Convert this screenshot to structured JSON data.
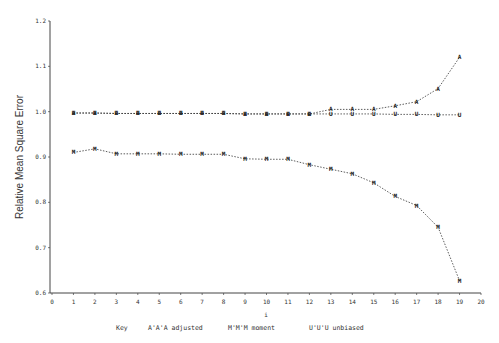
{
  "chart_data": {
    "type": "line",
    "title": "",
    "xlabel": "i",
    "ylabel": "Relative Mean Square Error",
    "xlim": [
      0,
      20
    ],
    "ylim": [
      0.6,
      1.2
    ],
    "x_ticks": [
      "0",
      "1",
      "2",
      "3",
      "4",
      "5",
      "6",
      "7",
      "8",
      "9",
      "10",
      "11",
      "12",
      "13",
      "14",
      "15",
      "16",
      "17",
      "18",
      "19",
      "20"
    ],
    "y_ticks": [
      "0.6",
      "0.7",
      "0.8",
      "0.9",
      "1.0",
      "1.1",
      "1.2"
    ],
    "grid": false,
    "legend_position": "bottom",
    "x": [
      1,
      2,
      3,
      4,
      5,
      6,
      7,
      8,
      9,
      10,
      11,
      12,
      13,
      14,
      15,
      16,
      17,
      18,
      19
    ],
    "series": [
      {
        "name": "adjusted",
        "marker": "A",
        "values": [
          0.997,
          0.997,
          0.996,
          0.996,
          0.996,
          0.996,
          0.996,
          0.996,
          0.995,
          0.995,
          0.995,
          0.995,
          1.005,
          1.005,
          1.005,
          1.013,
          1.022,
          1.051,
          1.12
        ]
      },
      {
        "name": "moment",
        "marker": "M",
        "values": [
          0.91,
          0.918,
          0.907,
          0.907,
          0.907,
          0.906,
          0.906,
          0.906,
          0.896,
          0.895,
          0.895,
          0.883,
          0.873,
          0.863,
          0.843,
          0.813,
          0.793,
          0.745,
          0.627
        ]
      },
      {
        "name": "unbiased",
        "marker": "U",
        "values": [
          0.997,
          0.997,
          0.996,
          0.996,
          0.996,
          0.996,
          0.996,
          0.996,
          0.995,
          0.995,
          0.995,
          0.995,
          0.995,
          0.995,
          0.995,
          0.994,
          0.994,
          0.993,
          0.993
        ]
      }
    ]
  },
  "legend": {
    "key_label": "Key",
    "items": [
      {
        "symbol": "A'A'A",
        "label": "adjusted"
      },
      {
        "symbol": "M'M'M",
        "label": "moment"
      },
      {
        "symbol": "U'U'U",
        "label": "unbiased"
      }
    ]
  }
}
